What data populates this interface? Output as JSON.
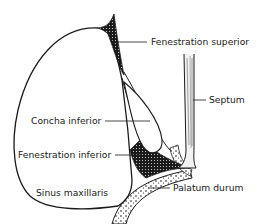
{
  "diagram": {
    "colors": {
      "ink": "#1a1a1a",
      "background": "#ffffff"
    },
    "labels": {
      "fenestration_superior": "Fenestration superior",
      "septum": "Septum",
      "concha_inferior": "Concha inferior",
      "fenestration_inferior": "Fenestration inferior",
      "sinus_maxillaris": "Sinus maxillaris",
      "palatum_durum": "Palatum durum"
    }
  }
}
